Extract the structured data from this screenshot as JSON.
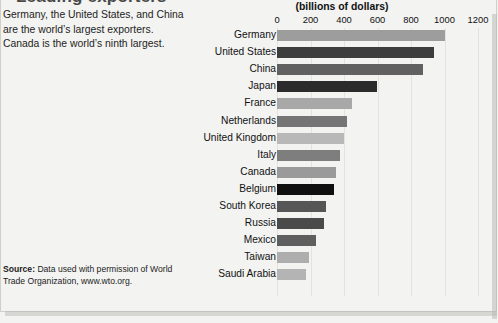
{
  "headline": "Leading exporters",
  "caption": "Germany, the United States, and China are the world’s largest exporters. Canada is the world’s ninth largest.",
  "source": {
    "label": "Source:",
    "text": " Data used with permission of World Trade Organization, www.wto.org."
  },
  "chart_data": {
    "type": "bar",
    "orientation": "horizontal",
    "title": "(billions of dollars)",
    "xlabel": "(billions of dollars)",
    "ylabel": "",
    "xlim": [
      0,
      1200
    ],
    "ticks": [
      0,
      200,
      400,
      600,
      800,
      1000,
      1200
    ],
    "tick_labels": [
      "0",
      "200",
      "400",
      "600",
      "800",
      "1000",
      "1200"
    ],
    "grid": true,
    "legend": "none",
    "categories": [
      "Germany",
      "United States",
      "China",
      "Japan",
      "France",
      "Netherlands",
      "United Kingdom",
      "Italy",
      "Canada",
      "Belgium",
      "South Korea",
      "Russia",
      "Mexico",
      "Taiwan",
      "Saudi Arabia"
    ],
    "values": [
      1000,
      940,
      870,
      595,
      445,
      420,
      400,
      375,
      350,
      340,
      295,
      280,
      230,
      190,
      175
    ],
    "bar_colors": [
      "#9d9d9d",
      "#3d3d3d",
      "#616161",
      "#2b2b2b",
      "#a8a8a8",
      "#757575",
      "#b8b8b8",
      "#7e7e7e",
      "#9a9a9a",
      "#101010",
      "#565656",
      "#4a4a4a",
      "#5f5f5f",
      "#aeaeae",
      "#b4b4b4"
    ]
  }
}
